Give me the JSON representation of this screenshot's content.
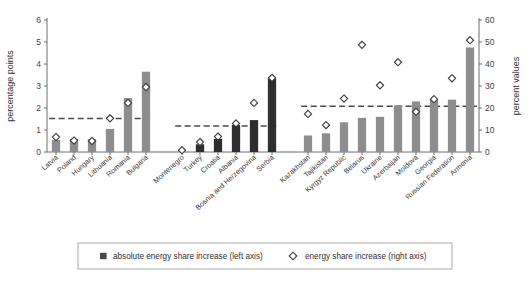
{
  "chart_data": {
    "type": "bar",
    "title": "",
    "subtitle": "",
    "ylabel": "percentage points",
    "y2label": "percent values",
    "xlabel": "",
    "ylim": [
      0,
      6
    ],
    "y2lim": [
      0,
      60
    ],
    "yticks": [
      "0",
      "1",
      "2",
      "3",
      "4",
      "5",
      "6"
    ],
    "y2ticks": [
      "0",
      "10",
      "20",
      "30",
      "40",
      "50",
      "60"
    ],
    "grid": false,
    "legend_position": "bottom",
    "legend": [
      {
        "key": "bars",
        "label": "absolute energy share increase (left axis)",
        "marker": "square",
        "color": "#4a4a4a"
      },
      {
        "key": "diamonds",
        "label": "energy share increase (right axis)",
        "marker": "diamond",
        "color": "#3a3a3a"
      }
    ],
    "groups": [
      {
        "name": "eu-new-member-states",
        "bar_color": "#8d8d8d",
        "average_line_value": 1.52,
        "categories": [
          "Latvia",
          "Poland",
          "Hungary",
          "Lithuania",
          "Romania",
          "Bulgaria"
        ],
        "series": [
          {
            "name": "absolute energy share increase (left axis)",
            "axis": "left",
            "values": [
              0.55,
              0.6,
              0.58,
              1.05,
              2.45,
              3.65
            ]
          },
          {
            "name": "energy share increase (right axis)",
            "axis": "right",
            "values": [
              6.8,
              5.2,
              5.0,
              15.3,
              22.3,
              29.5
            ]
          }
        ]
      },
      {
        "name": "western-balkans-and-turkey",
        "bar_color": "#2e2e2e",
        "average_line_value": 1.18,
        "categories": [
          "Montenegro",
          "Turkey",
          "Croatia",
          "Albania",
          "Bosnia and Herzegovina",
          "Serbia"
        ],
        "series": [
          {
            "name": "absolute energy share increase (left axis)",
            "axis": "left",
            "values": [
              0.0,
              0.35,
              0.6,
              1.22,
              1.45,
              3.35
            ]
          },
          {
            "name": "energy share increase (right axis)",
            "axis": "right",
            "values": [
              0.8,
              4.5,
              7.0,
              13.0,
              22.3,
              33.7
            ]
          }
        ]
      },
      {
        "name": "cis-countries",
        "bar_color": "#8d8d8d",
        "average_line_value": 2.08,
        "categories": [
          "Kazakhstan",
          "Tajikistan",
          "Kyrgyz Republic",
          "Belarus",
          "Ukraine",
          "Azerbaijan",
          "Moldova",
          "Georgia",
          "Russian Federation",
          "Armenia"
        ],
        "series": [
          {
            "name": "absolute energy share increase (left axis)",
            "axis": "left",
            "values": [
              0.75,
              0.85,
              1.35,
              1.55,
              1.6,
              2.12,
              2.3,
              2.4,
              2.38,
              4.75
            ]
          },
          {
            "name": "energy share increase (right axis)",
            "axis": "right",
            "values": [
              17.3,
              12.2,
              24.3,
              48.7,
              30.3,
              40.8,
              18.3,
              24.0,
              33.5,
              50.8
            ]
          }
        ]
      }
    ]
  }
}
